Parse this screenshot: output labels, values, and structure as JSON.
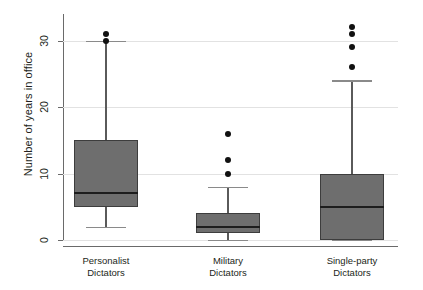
{
  "chart_data": {
    "type": "box",
    "title": "",
    "xlabel": "",
    "ylabel": "Number of years in office",
    "ylim": [
      0,
      34
    ],
    "yticks": [
      0,
      10,
      20,
      30
    ],
    "ytick_labels": [
      "0",
      "10",
      "20",
      "30"
    ],
    "grid": true,
    "legend": "none",
    "categories": [
      "Personalist Dictators",
      "Military Dictators",
      "Single-party Dictators"
    ],
    "category_lines": [
      [
        "Personalist",
        "Dictators"
      ],
      [
        "Military",
        "Dictators"
      ],
      [
        "Single-party",
        "Dictators"
      ]
    ],
    "boxes": [
      {
        "name": "Personalist Dictators",
        "whisker_low": 2,
        "q1": 5,
        "median": 7,
        "q3": 15,
        "whisker_high": 30,
        "outliers": [
          30,
          31
        ]
      },
      {
        "name": "Military Dictators",
        "whisker_low": 0,
        "q1": 1,
        "median": 2,
        "q3": 4,
        "whisker_high": 8,
        "outliers": [
          10,
          12,
          16
        ]
      },
      {
        "name": "Single-party Dictators",
        "whisker_low": 0,
        "q1": 0,
        "median": 5,
        "q3": 10,
        "whisker_high": 24,
        "outliers": [
          26,
          29,
          31,
          32
        ]
      }
    ],
    "colors": {
      "box_fill": "#6e6e6e",
      "box_edge": "#3d3d3d",
      "median": "#1d1d1d",
      "whisker": "#5a5a5a",
      "outlier": "#111111",
      "grid": "#e2e2e2",
      "axis": "#6a6a6a",
      "text": "#231f20",
      "background": "#ffffff"
    }
  }
}
